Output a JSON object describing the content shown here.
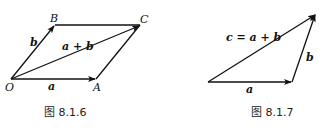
{
  "figures": [
    {
      "caption": "图 8.1.6",
      "points": {
        "O": "O",
        "A": "A",
        "B": "B",
        "C": "C"
      },
      "vectors": {
        "a": "a",
        "b": "b",
        "sum": "a + b"
      }
    },
    {
      "caption": "图 8.1.7",
      "vectors": {
        "a": "a",
        "b": "b",
        "sum": "c = a + b"
      }
    }
  ],
  "colors": {
    "stroke": "#111111",
    "background": "#ffffff"
  }
}
